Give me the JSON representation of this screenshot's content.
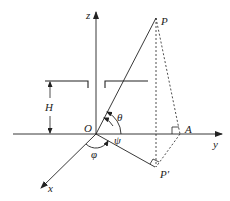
{
  "diagram": {
    "type": "3d-coordinate-geometry",
    "labels": {
      "z_axis": "z",
      "y_axis": "y",
      "x_axis": "x",
      "origin": "O",
      "point_p": "P",
      "point_a": "A",
      "point_p_prime": "P′",
      "height": "H",
      "angle_theta": "θ",
      "angle_psi": "ψ",
      "angle_phi": "φ"
    },
    "colors": {
      "stroke": "#222222",
      "background": "#ffffff"
    }
  }
}
